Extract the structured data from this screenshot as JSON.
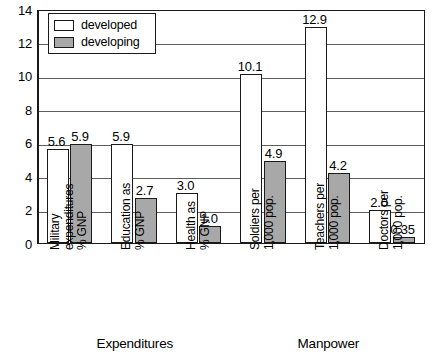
{
  "chart_data": {
    "type": "bar",
    "title": "",
    "xlabel": "",
    "ylabel": "",
    "ylim": [
      0,
      14
    ],
    "yticks": [
      0,
      2,
      4,
      6,
      8,
      10,
      12,
      14
    ],
    "grid": true,
    "legend_position": "top-left",
    "categories": [
      "Military expenditures % GNP",
      "Education as % GNP",
      "Health as % GNP",
      "Soldiers per 1,000 pop.",
      "Teachers per 1,000 pop.",
      "Doctors per 1,000 pop."
    ],
    "category_lines": [
      [
        "Military",
        "expenditures",
        "% GNP"
      ],
      [
        "Education as",
        "% GNP"
      ],
      [
        "Health as",
        "% GNP"
      ],
      [
        "Soldiers per",
        "1,000 pop."
      ],
      [
        "Teachers per",
        "1,000 pop."
      ],
      [
        "Doctors per",
        "1,000 pop."
      ]
    ],
    "series": [
      {
        "name": "developed",
        "color": "#ffffff",
        "values": [
          5.6,
          5.9,
          3.0,
          10.1,
          12.9,
          2.0
        ],
        "labels": [
          "5.6",
          "5.9",
          "3.0",
          "10.1",
          "12.9",
          "2.0"
        ]
      },
      {
        "name": "developing",
        "color": "#a8a8a8",
        "values": [
          5.9,
          2.7,
          1.0,
          4.9,
          4.2,
          0.35
        ],
        "labels": [
          "5.9",
          "2.7",
          "1.0",
          "4.9",
          "4.2",
          "0.35"
        ]
      }
    ],
    "groups": [
      {
        "label": "Expenditures",
        "categories": [
          0,
          1,
          2
        ]
      },
      {
        "label": "Manpower",
        "categories": [
          3,
          4,
          5
        ]
      }
    ]
  },
  "legend": {
    "items": [
      {
        "label": "developed",
        "swatch": "developed"
      },
      {
        "label": "developing",
        "swatch": "developing"
      }
    ]
  }
}
